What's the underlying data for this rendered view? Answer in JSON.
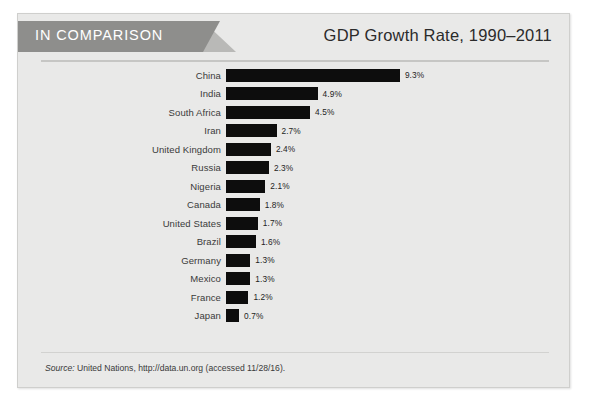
{
  "banner": {
    "label": "IN COMPARISON",
    "background_color": "#8e8e8c",
    "text_color": "#ffffff"
  },
  "header": {
    "title": "GDP Growth Rate, 1990–2011"
  },
  "footer": {
    "source_label": "Source:",
    "source_text": " United Nations, http://data.un.org (accessed 11/28/16)."
  },
  "chart_data": {
    "type": "bar",
    "orientation": "horizontal",
    "title": "GDP Growth Rate, 1990–2011",
    "xlabel": "",
    "ylabel": "",
    "xlim": [
      0,
      9.3
    ],
    "grid": false,
    "legend": false,
    "bar_color": "#0d0d0d",
    "value_suffix": "%",
    "categories": [
      "China",
      "India",
      "South Africa",
      "Iran",
      "United Kingdom",
      "Russia",
      "Nigeria",
      "Canada",
      "United States",
      "Brazil",
      "Germany",
      "Mexico",
      "France",
      "Japan"
    ],
    "values": [
      9.3,
      4.9,
      4.5,
      2.7,
      2.4,
      2.3,
      2.1,
      1.8,
      1.7,
      1.6,
      1.3,
      1.3,
      1.2,
      0.7
    ],
    "value_labels": [
      "9.3%",
      "4.9%",
      "4.5%",
      "2.7%",
      "2.4%",
      "2.3%",
      "2.1%",
      "1.8%",
      "1.7%",
      "1.6%",
      "1.3%",
      "1.3%",
      "1.2%",
      "0.7%"
    ]
  }
}
